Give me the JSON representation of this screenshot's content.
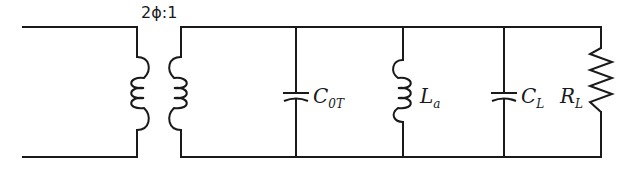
{
  "diagram": {
    "type": "equivalent-circuit",
    "transformer": {
      "ratio_label": "2ϕ:1"
    },
    "components": [
      {
        "id": "C0T",
        "kind": "capacitor",
        "symbol": "C",
        "subscript": "0T"
      },
      {
        "id": "La",
        "kind": "inductor",
        "symbol": "L",
        "subscript": "a"
      },
      {
        "id": "CL",
        "kind": "capacitor",
        "symbol": "C",
        "subscript": "L"
      },
      {
        "id": "RL",
        "kind": "resistor",
        "symbol": "R",
        "subscript": "L"
      }
    ],
    "colors": {
      "line": "#1a1a1a",
      "background": "#ffffff"
    }
  }
}
